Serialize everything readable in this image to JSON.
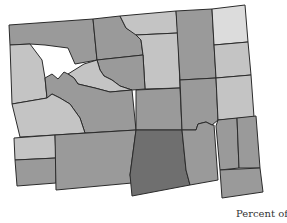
{
  "map": {
    "region": "Wyoming counties",
    "colors": {
      "lightest": "#dcdcdc",
      "light": "#c4c4c4",
      "medium": "#9a9a9a",
      "dark": "#6f6f6f",
      "border": "#2b2b2b"
    },
    "counties": [
      {
        "id": "park",
        "shade": "medium",
        "points": "9,25 93,19 97,60 75,64 68,48 45,45 30,44 10,45"
      },
      {
        "id": "big-horn",
        "shade": "medium",
        "points": "93,19 120,16 126,28 135,33 141,40 143,55 97,60"
      },
      {
        "id": "sheridan",
        "shade": "light",
        "points": "120,16 176,11 178,33 136,35 126,28"
      },
      {
        "id": "johnson",
        "shade": "light",
        "points": "136,35 178,33 180,88 145,89 143,55 141,40"
      },
      {
        "id": "campbell",
        "shade": "medium",
        "points": "176,11 212,9 216,78 180,80"
      },
      {
        "id": "crook",
        "shade": "lightest",
        "points": "212,9 245,5 248,42 214,45"
      },
      {
        "id": "weston",
        "shade": "light",
        "points": "214,45 248,42 251,75 216,78"
      },
      {
        "id": "teton",
        "shade": "light",
        "points": "10,45 30,44 42,60 45,78 47,98 12,104"
      },
      {
        "id": "washakie",
        "shade": "medium",
        "points": "97,60 143,55 145,89 132,90 120,86 112,80 104,76 100,70"
      },
      {
        "id": "hot-springs",
        "shade": "light",
        "points": "68,74 84,64 97,60 100,70 104,76 112,80 120,86 132,90 110,92 95,88 78,84 74,78"
      },
      {
        "id": "fremont",
        "shade": "medium",
        "points": "45,78 52,74 58,79 64,72 68,74 74,78 78,84 95,88 110,92 132,90 136,130 85,133 80,118 70,104 60,98 52,94 47,98"
      },
      {
        "id": "sublette",
        "shade": "light",
        "points": "12,104 47,98 52,94 60,98 70,104 80,118 85,133 55,135 20,137"
      },
      {
        "id": "lincoln",
        "shade": "light",
        "points": "14,138 55,135 56,158 15,160"
      },
      {
        "id": "uinta",
        "shade": "medium",
        "points": "15,160 56,158 56,183 17,186"
      },
      {
        "id": "sweetwater",
        "shade": "medium",
        "points": "55,135 136,130 130,175 132,183 56,190"
      },
      {
        "id": "natrona",
        "shade": "medium",
        "points": "136,90 180,88 182,130 136,130"
      },
      {
        "id": "converse",
        "shade": "medium",
        "points": "180,80 216,78 218,120 212,125 206,122 198,124 196,130 182,130"
      },
      {
        "id": "niobrara",
        "shade": "light",
        "points": "216,78 251,75 254,117 218,120"
      },
      {
        "id": "carbon",
        "shade": "dark",
        "points": "136,130 182,130 186,170 190,185 132,196 130,175"
      },
      {
        "id": "albany",
        "shade": "medium",
        "points": "182,130 196,130 198,124 206,122 212,125 214,125 218,180 190,185 186,170"
      },
      {
        "id": "platte",
        "shade": "medium",
        "points": "218,120 237,118 239,168 220,170 216,126"
      },
      {
        "id": "goshen",
        "shade": "medium",
        "points": "237,118 256,116 260,168 239,168"
      },
      {
        "id": "laramie",
        "shade": "medium",
        "points": "220,170 260,168 263,192 222,198"
      }
    ]
  },
  "legend": {
    "title": "Percent of"
  }
}
